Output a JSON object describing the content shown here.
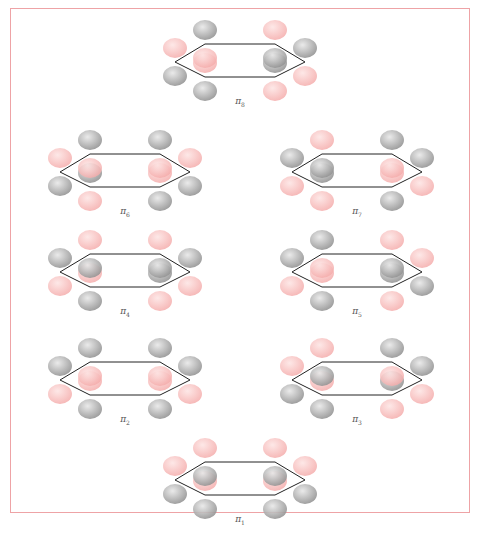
{
  "figure": {
    "border_color": "#eea3a6",
    "lobe_colors": {
      "positive": "#f4a9a8",
      "negative": "#8f8f8f"
    },
    "ring_color": "#222222"
  },
  "panels": [
    {
      "id": "pi8",
      "symbol": "π",
      "index": "8",
      "x": 145,
      "y": 14,
      "top": [
        "p",
        "n",
        "p",
        "n",
        "n",
        "p"
      ],
      "bottom": [
        "n",
        "p",
        "n",
        "p",
        "p",
        "n"
      ]
    },
    {
      "id": "pi6",
      "symbol": "π",
      "index": "6",
      "x": 30,
      "y": 124,
      "top": [
        "p",
        "n",
        "n",
        "p",
        "p",
        "n"
      ],
      "bottom": [
        "n",
        "p",
        "p",
        "n",
        "n",
        "p"
      ]
    },
    {
      "id": "pi7",
      "symbol": "π",
      "index": "7",
      "x": 262,
      "y": 124,
      "top": [
        "n",
        "p",
        "n",
        "n",
        "p",
        "n"
      ],
      "bottom": [
        "p",
        "n",
        "p",
        "p",
        "n",
        "p"
      ]
    },
    {
      "id": "pi4",
      "symbol": "π",
      "index": "4",
      "x": 30,
      "y": 224,
      "top": [
        "n",
        "p",
        "p",
        "n",
        "n",
        "p"
      ],
      "bottom": [
        "p",
        "n",
        "n",
        "p",
        "p",
        "n"
      ]
    },
    {
      "id": "pi5",
      "symbol": "π",
      "index": "5",
      "x": 262,
      "y": 224,
      "top": [
        "n",
        "n",
        "p",
        "p",
        "n",
        "p"
      ],
      "bottom": [
        "p",
        "p",
        "n",
        "n",
        "p",
        "n"
      ]
    },
    {
      "id": "pi2",
      "symbol": "π",
      "index": "2",
      "x": 30,
      "y": 332,
      "top": [
        "n",
        "n",
        "n",
        "n",
        "p",
        "p"
      ],
      "bottom": [
        "p",
        "p",
        "p",
        "p",
        "n",
        "n"
      ]
    },
    {
      "id": "pi3",
      "symbol": "π",
      "index": "3",
      "x": 262,
      "y": 332,
      "top": [
        "p",
        "p",
        "n",
        "n",
        "n",
        "p"
      ],
      "bottom": [
        "n",
        "n",
        "p",
        "p",
        "p",
        "n"
      ]
    },
    {
      "id": "pi1",
      "symbol": "π",
      "index": "1",
      "x": 145,
      "y": 432,
      "top": [
        "p",
        "p",
        "p",
        "p",
        "p",
        "p"
      ],
      "bottom": [
        "n",
        "n",
        "n",
        "n",
        "n",
        "n"
      ]
    }
  ]
}
